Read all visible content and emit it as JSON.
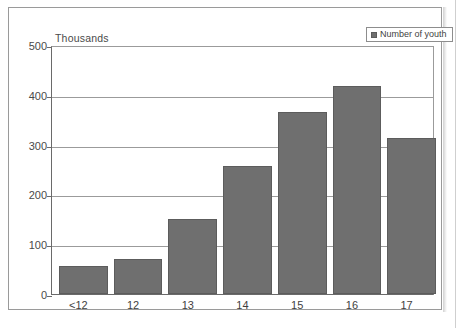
{
  "figure": {
    "units_label": "Thousands"
  },
  "legend": {
    "swatch_icon": "square-marker-icon",
    "entries": [
      {
        "label": "Number of youth",
        "color": "#6f6f6f"
      }
    ]
  },
  "chart_data": {
    "type": "bar",
    "title": "",
    "subtitle": "",
    "xlabel": "",
    "ylabel": "Thousands",
    "categories": [
      "<12",
      "12",
      "13",
      "14",
      "15",
      "16",
      "17"
    ],
    "series": [
      {
        "name": "Number of youth",
        "color": "#6f6f6f",
        "values": [
          56,
          71,
          150,
          258,
          366,
          417,
          313
        ]
      }
    ],
    "ylim": [
      0,
      500
    ],
    "yticks": [
      0,
      100,
      200,
      300,
      400,
      500
    ],
    "ytick_labels": [
      "0",
      "100",
      "200",
      "300",
      "400",
      "500"
    ],
    "grid": true,
    "grid_axis": "y",
    "legend_position": "top-right",
    "units": "Thousands",
    "annotations": []
  }
}
